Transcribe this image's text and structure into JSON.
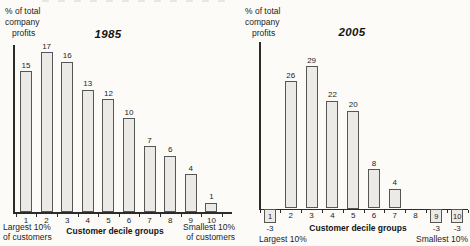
{
  "chart_data": [
    {
      "type": "bar",
      "title": "1985",
      "ylabel": "% of total company profits",
      "ylabel_lines": [
        "% of total",
        "company",
        "profits"
      ],
      "xlabel": "Customer decile groups",
      "categories": [
        "1",
        "2",
        "3",
        "4",
        "5",
        "6",
        "7",
        "8",
        "9",
        "10"
      ],
      "values": [
        15,
        17,
        16,
        13,
        12,
        10,
        7,
        6,
        4,
        1
      ],
      "captions": {
        "left": [
          "Largest 10%",
          "of customers"
        ],
        "right": [
          "Smallest 10%",
          "of customers"
        ]
      },
      "ylim": [
        0,
        18
      ],
      "grid": false,
      "legend": "none",
      "bar_fill": "#ebeae6",
      "bar_border": "#565656",
      "axis_color": "#2b2b2b",
      "text_color": "#1c1c1c"
    },
    {
      "type": "bar",
      "title": "2005",
      "ylabel": "% of total company profits",
      "ylabel_lines": [
        "% of total",
        "company",
        "profits"
      ],
      "xlabel": "Customer decile groups",
      "categories": [
        "1",
        "2",
        "3",
        "4",
        "5",
        "6",
        "7",
        "8",
        "9",
        "10"
      ],
      "values": [
        -3,
        26,
        29,
        22,
        20,
        8,
        4,
        0,
        -3,
        -3
      ],
      "captions": {
        "left": [
          "Largest 10%"
        ],
        "right": [
          "Smallest 10%"
        ]
      },
      "ylim": [
        -3,
        30
      ],
      "grid": false,
      "legend": "none",
      "bar_fill": "#ebeae6",
      "bar_border": "#565656",
      "axis_color": "#2b2b2b",
      "text_color": "#1c1c1c"
    }
  ]
}
